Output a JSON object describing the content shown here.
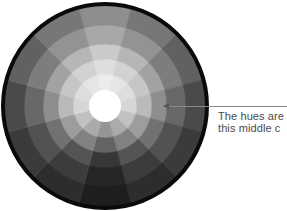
{
  "diagram": {
    "wheel": {
      "center": [
        105,
        106
      ],
      "outer_radius": 104,
      "border_width": 4,
      "border_color": "#0a0a0a",
      "center_radius": 16,
      "center_color": "#ffffff",
      "ring_radii": [
        16,
        32,
        47,
        62,
        81,
        101
      ],
      "segment_count": 12,
      "segment_offset_deg": -15,
      "ring_gray_top": [
        236,
        222,
        202,
        168,
        142
      ],
      "ring_gray_side": [
        214,
        186,
        142,
        104,
        74
      ],
      "ring_gray_bottom": [
        150,
        100,
        55,
        38,
        30
      ]
    },
    "callout": {
      "line1": "The hues are",
      "line2": "this middle c",
      "pointer": "arrow pointing left into the middle ring of the wheel"
    }
  }
}
